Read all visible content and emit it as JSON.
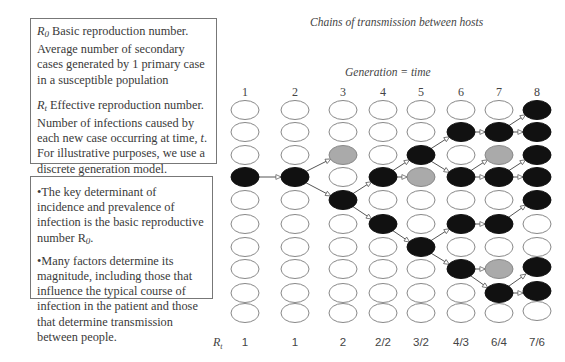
{
  "definitions": {
    "r0": {
      "symbol": "R",
      "subscript": "0",
      "text": " Basic reproduction number. Average number of secondary cases generated by 1 primary case in a susceptible population"
    },
    "rt": {
      "symbol": "R",
      "subscript": "t",
      "text_before": " Effective reproduction number. Number of infections caused by each new case occurring at time, ",
      "time_var": "t",
      "text_after": ". For illustrative purposes, we use a discrete generation model."
    }
  },
  "notes": {
    "bullet1": {
      "text": "•The key determinant of incidence and prevalence of infection is the basic reproductive number R",
      "subscript": "0",
      "end": "."
    },
    "bullet2": {
      "text": "•Many factors determine its magnitude, including those that influence the typical course of infection in the patient and those that determine transmission between people."
    }
  },
  "diagram": {
    "title": "Chains of transmission between hosts",
    "axis_title": "Generation = time",
    "generations": [
      "1",
      "2",
      "3",
      "4",
      "5",
      "6",
      "7",
      "8"
    ],
    "rt_label": "R",
    "rt_label_sub": "t",
    "rt_values": [
      "1",
      "1",
      "2",
      "2/2",
      "3/2",
      "4/3",
      "6/4",
      "7/6"
    ],
    "colors": {
      "infected": "#111111",
      "non_transmitting": "#aaaaaa",
      "susceptible": "#ffffff",
      "edge": "#555555"
    },
    "legend_states": {
      "0": "susceptible",
      "1": "infected",
      "2": "infected-no-onward-transmission"
    },
    "grid_states": [
      [
        0,
        0,
        0,
        1,
        0,
        0,
        0,
        0,
        0,
        0
      ],
      [
        0,
        0,
        0,
        1,
        0,
        0,
        0,
        0,
        0,
        0
      ],
      [
        0,
        0,
        2,
        0,
        1,
        0,
        0,
        0,
        0,
        0
      ],
      [
        0,
        0,
        0,
        1,
        0,
        1,
        0,
        0,
        0,
        0
      ],
      [
        0,
        0,
        1,
        2,
        0,
        0,
        1,
        0,
        0,
        0
      ],
      [
        0,
        1,
        0,
        1,
        0,
        1,
        0,
        1,
        0,
        0
      ],
      [
        0,
        1,
        2,
        1,
        0,
        1,
        0,
        2,
        1,
        0
      ],
      [
        1,
        1,
        1,
        1,
        1,
        0,
        0,
        1,
        1,
        0
      ]
    ],
    "edges": [
      [
        0,
        3,
        1,
        3
      ],
      [
        1,
        3,
        2,
        2
      ],
      [
        1,
        3,
        2,
        4
      ],
      [
        2,
        4,
        3,
        3
      ],
      [
        2,
        4,
        3,
        5
      ],
      [
        3,
        3,
        4,
        2
      ],
      [
        3,
        3,
        4,
        3
      ],
      [
        3,
        5,
        4,
        6
      ],
      [
        4,
        2,
        5,
        1
      ],
      [
        4,
        2,
        5,
        3
      ],
      [
        4,
        6,
        5,
        5
      ],
      [
        4,
        6,
        5,
        7
      ],
      [
        5,
        1,
        6,
        1
      ],
      [
        5,
        3,
        6,
        2
      ],
      [
        5,
        3,
        6,
        3
      ],
      [
        5,
        5,
        6,
        5
      ],
      [
        5,
        7,
        6,
        7
      ],
      [
        5,
        7,
        6,
        8
      ],
      [
        6,
        1,
        7,
        0
      ],
      [
        6,
        1,
        7,
        1
      ],
      [
        6,
        3,
        7,
        2
      ],
      [
        6,
        3,
        7,
        3
      ],
      [
        6,
        5,
        7,
        4
      ],
      [
        6,
        8,
        7,
        7
      ],
      [
        6,
        8,
        7,
        8
      ]
    ]
  }
}
